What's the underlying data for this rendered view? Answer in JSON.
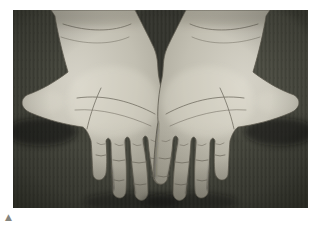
{
  "figure": {
    "alt": "Photograph of two outstretched hands with palms facing upward and fingers spread, pale palms shown against a dark fabric background",
    "marker": {
      "glyph": "▲"
    }
  },
  "colors": {
    "page_bg": "#ffffff",
    "fabric_base": "#44453c",
    "fabric_stripe_dark": "#3a3b33",
    "fabric_stripe_light": "#4b4c42",
    "fabric_corner": "#272822",
    "skin_light": "#d6d3c8",
    "skin_mid": "#c2bfb2",
    "skin_deep": "#a5a295",
    "skin_shadow": "#8a8678",
    "crease": "#817d6f",
    "marker": "#85857e"
  }
}
